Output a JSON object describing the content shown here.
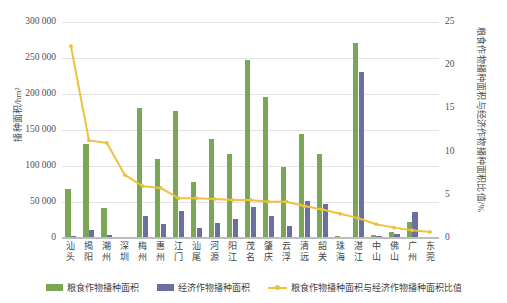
{
  "chart_data": {
    "type": "bar",
    "title": "",
    "subtitle": "",
    "xlabel": "",
    "ylabel": "播种面积/hm²",
    "y2label": "粮食作物播种面积与经济作物播种面积比值/%",
    "grid": true,
    "legend_position": "bottom",
    "ylim": [
      0,
      300000
    ],
    "y2lim": [
      0,
      25
    ],
    "yticks": [
      "0",
      "50 000",
      "100 000",
      "150 000",
      "200 000",
      "250 000",
      "300 000"
    ],
    "ytick_values": [
      0,
      50000,
      100000,
      150000,
      200000,
      250000,
      300000
    ],
    "y2ticks": [
      "0",
      "5",
      "10",
      "15",
      "20",
      "25"
    ],
    "y2tick_values": [
      0,
      5,
      10,
      15,
      20,
      25
    ],
    "categories": [
      "汕头",
      "揭阳",
      "潮州",
      "深圳",
      "梅州",
      "惠州",
      "江门",
      "汕尾",
      "河源",
      "阳江",
      "茂名",
      "肇庆",
      "云浮",
      "清远",
      "韶关",
      "珠海",
      "湛江",
      "中山",
      "佛山",
      "广州",
      "东莞"
    ],
    "series": [
      {
        "name": "粮食作物播种面积",
        "axis": "left",
        "color": "#7aa756",
        "values": [
          68000,
          130000,
          41000,
          2000,
          181000,
          110000,
          176000,
          78000,
          137000,
          117000,
          247000,
          196000,
          98000,
          145000,
          116000,
          3000,
          271000,
          4000,
          9000,
          22000,
          2000
        ]
      },
      {
        "name": "经济作物播种面积",
        "axis": "left",
        "color": "#6b6f9e",
        "values": [
          3000,
          11000,
          4000,
          1000,
          30000,
          19000,
          38000,
          14000,
          21000,
          26000,
          43000,
          30000,
          17000,
          52000,
          47000,
          2000,
          231000,
          3000,
          6000,
          36000,
          2000
        ]
      },
      {
        "name": "粮食作物播种面积与经济作物播种面积比值",
        "axis": "right",
        "color": "#efc13e",
        "values": [
          22.2,
          11.3,
          11.0,
          7.3,
          6.0,
          5.8,
          4.6,
          4.6,
          4.5,
          4.4,
          4.4,
          4.2,
          4.2,
          3.7,
          3.3,
          2.8,
          2.3,
          1.6,
          1.2,
          0.9,
          0.7
        ]
      }
    ]
  },
  "legend": {
    "items": [
      {
        "label": "粮食作物播种面积",
        "type": "bar",
        "color": "#7aa756"
      },
      {
        "label": "经济作物播种面积",
        "type": "bar",
        "color": "#6b6f9e"
      },
      {
        "label": "粮食作物播种面积与经济作物播种面积比值",
        "type": "line",
        "color": "#efc13e"
      }
    ]
  }
}
